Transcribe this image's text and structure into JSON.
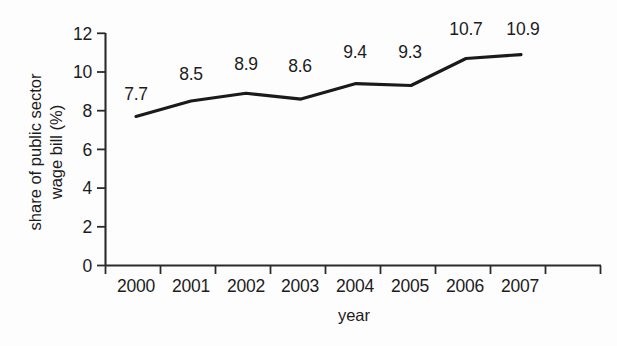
{
  "chart_data": {
    "type": "line",
    "title": "",
    "xlabel": "year",
    "ylabel": "share of public sector wage bill (%)",
    "ylabel_lines": [
      "share of public sector",
      "wage bill (%)"
    ],
    "categories": [
      "2000",
      "2001",
      "2002",
      "2003",
      "2004",
      "2005",
      "2006",
      "2007"
    ],
    "values": [
      7.7,
      8.5,
      8.9,
      8.6,
      9.4,
      9.3,
      10.7,
      10.9
    ],
    "point_labels": [
      "7.7",
      "8.5",
      "8.9",
      "8.6",
      "9.4",
      "9.3",
      "10.7",
      "10.9"
    ],
    "ylim": [
      0,
      12
    ],
    "yticks": [
      0,
      2,
      4,
      6,
      8,
      10,
      12
    ],
    "ytick_labels": [
      "0",
      "2",
      "4",
      "6",
      "8",
      "10",
      "12"
    ],
    "grid": false,
    "legend": false,
    "series_color": "#1a1a1a",
    "axis_color": "#2b2b2b",
    "text_color": "#1c1c1c",
    "background_color": "#fdfdfd",
    "xtick_count": 10,
    "xaxis_note": "x tick marks bracket each year label; labels sit between ticks"
  }
}
